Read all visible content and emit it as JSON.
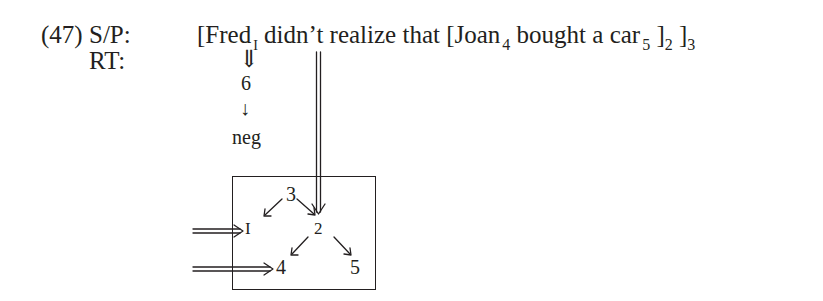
{
  "example": {
    "number": "(47)",
    "labels": {
      "sp": "S/P:",
      "rt": "RT:"
    },
    "sentence": {
      "open_bracket_1": "[",
      "fred": "Fred",
      "fred_index": "I",
      "middle": "didn’t realize that ",
      "open_bracket_2": "[",
      "joan": "Joan",
      "joan_index": "4",
      "bought": "bought a car",
      "car_index": "5",
      "close_bracket_2": "]",
      "close_index_2": "2",
      "close_bracket_3": "]",
      "close_index_3": "3"
    },
    "rt_chain": {
      "double_arrow": "⇓",
      "six": "6",
      "arrow": "↓",
      "neg": "neg"
    },
    "box_nodes": {
      "n3": "3",
      "n1": "I",
      "n2": "2",
      "n4": "4",
      "n5": "5"
    }
  }
}
